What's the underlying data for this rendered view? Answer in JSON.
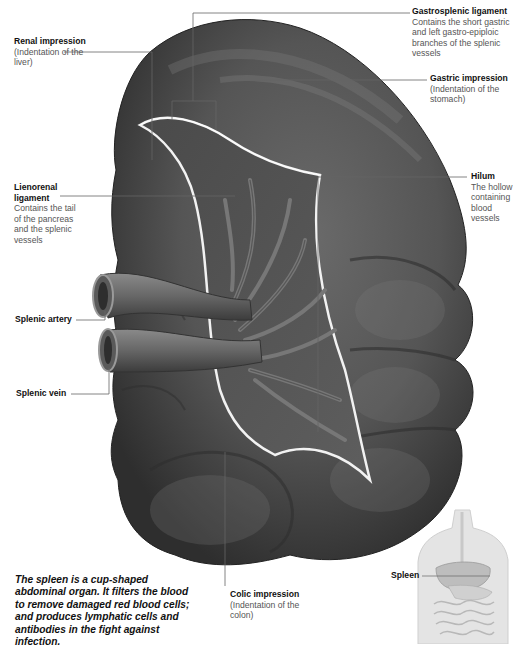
{
  "figure": {
    "caption": "The spleen is a cup-shaped abdominal organ. It filters the blood to remove damaged red blood cells; and produces lymphatic cells and antibodies in the fight against infection."
  },
  "labels": {
    "renal_impression": {
      "title": "Renal impression",
      "desc": "(Indentation of the liver)"
    },
    "gastrosplenic_ligament": {
      "title": "Gastrosplenic ligament",
      "desc": "Contains the short gastric and left gastro-epiploic branches of the splenic vessels"
    },
    "gastric_impression": {
      "title": "Gastric impression",
      "desc": "(Indentation of the stomach)"
    },
    "lienorenal_ligament": {
      "title": "Lienorenal ligament",
      "desc": "Contains the tail of the pancreas and the splenic vessels"
    },
    "hilum": {
      "title": "Hilum",
      "desc": "The hollow containing blood vessels"
    },
    "splenic_artery": {
      "title": "Splenic artery"
    },
    "splenic_vein": {
      "title": "Splenic vein"
    },
    "colic_impression": {
      "title": "Colic impression",
      "desc": "(Indentation of the colon)"
    }
  },
  "inset": {
    "label": "Spleen",
    "description": "Torso location diagram"
  },
  "colors": {
    "organ_dark": "#3a3a3a",
    "organ_mid": "#5c5c5c",
    "organ_light": "#8a8a8a",
    "hilum_edge": "#f2f2f2",
    "leader_line": "#666666",
    "inset_fill": "#e4e4e4"
  }
}
